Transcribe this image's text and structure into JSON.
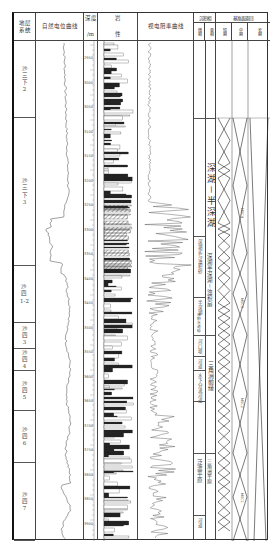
{
  "headers": {
    "strat_system": "地层\n系统",
    "sp_curve": "自然电位曲线",
    "depth": "深度",
    "depth_unit": "/m",
    "lithology_1": "岩",
    "lithology_2": "性",
    "resistivity": "视电阻率曲线",
    "sedimentary_facies": "沉积相",
    "facies_sub": "微相",
    "facies_phase": "亚相",
    "cycle": "基准面旋回",
    "cycle_short": "短期",
    "cycle_mid": "中期",
    "cycle_long": "长期"
  },
  "strata": [
    {
      "label": "沙\n三\n下\n2",
      "top": 28,
      "height": 77
    },
    {
      "label": "沙\n三\n下\n3",
      "top": 105,
      "height": 148
    },
    {
      "label": "沙\n四\n1-2",
      "top": 253,
      "height": 57
    },
    {
      "label": "沙\n四\n3",
      "top": 310,
      "height": 26
    },
    {
      "label": "沙\n四\n4",
      "top": 336,
      "height": 22
    },
    {
      "label": "沙\n四\n5",
      "top": 358,
      "height": 40
    },
    {
      "label": "沙\n四\n6",
      "top": 398,
      "height": 52
    },
    {
      "label": "沙\n四\n7",
      "top": 450,
      "height": 78
    }
  ],
  "depth_ticks": [
    "2950",
    "3000",
    "3050",
    "3100",
    "3150",
    "3200",
    "3250",
    "3300",
    "3350",
    "3400",
    "3450",
    "3500",
    "3550",
    "3600",
    "3650",
    "3700",
    "3750",
    "3800",
    "3850",
    "3900",
    "3950"
  ],
  "facies": {
    "deep_lake": "深湖－半深湖",
    "deep_shallow": "深湖半深湖－浊积扇",
    "semi_deep": "半深湖",
    "delta_front": "三角洲前缘",
    "delta_plain": "三角洲平原",
    "micro_1": "深湖泥与浊积砂",
    "micro_2": "浊积水道砂",
    "micro_3": "河口坝",
    "micro_4": "水下分流河道",
    "micro_5": "河道",
    "micro_6": "分流河道",
    "micro_7": "泛滥平原",
    "micro_8": "河道"
  },
  "msc_labels": [
    "MSC4",
    "MSC3",
    "MSC2",
    "MSC1"
  ],
  "colors": {
    "line": "#333333",
    "border": "#444444",
    "text": "#333333",
    "background": "#ffffff"
  },
  "chart_data": {
    "type": "table",
    "columns": [
      "地层系统",
      "自然电位曲线",
      "深度/m",
      "岩性",
      "视电阻率曲线",
      "沉积相(微相,亚相)",
      "基准面旋回(短期,中期,长期)"
    ],
    "depth_range_m": [
      2950,
      3960
    ],
    "strata": [
      "沙三下2",
      "沙三下3",
      "沙四1-2",
      "沙四3",
      "沙四4",
      "沙四5",
      "沙四6",
      "沙四7"
    ],
    "subfacies": [
      "深湖－半深湖",
      "深湖半深湖－浊积扇",
      "三角洲前缘",
      "三角洲平原"
    ],
    "mid_term_cycles": [
      "MSC4",
      "MSC3",
      "MSC2",
      "MSC1"
    ]
  }
}
